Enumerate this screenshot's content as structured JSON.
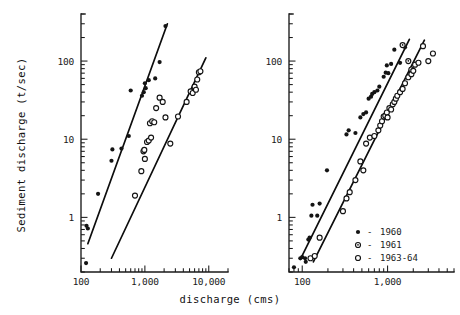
{
  "figure": {
    "xlabel": "discharge (cms)",
    "ylabel": "Sediment discharge (t/sec)",
    "ink_color": "#141414",
    "background": "#ffffff"
  },
  "legend": {
    "position": "lower-right of right panel",
    "entries": [
      {
        "marker": "filled-circle",
        "dash": "-",
        "label": "1960"
      },
      {
        "marker": "dotted-circle",
        "dash": "-",
        "label": "1961"
      },
      {
        "marker": "open-circle",
        "dash": "-",
        "label": "1963-64"
      }
    ]
  },
  "chart_data": [
    {
      "type": "scatter",
      "panel": "left",
      "title": "",
      "xlabel": "discharge (cms)",
      "ylabel": "Sediment discharge (t/sec)",
      "xscale": "log",
      "yscale": "log",
      "xlim": [
        100,
        20000
      ],
      "ylim": [
        0.2,
        400
      ],
      "xticks": [
        100,
        1000,
        10000
      ],
      "xticklabels": [
        "100",
        "1,000",
        "10,000"
      ],
      "yticks": [
        1,
        10,
        100
      ],
      "yticklabels": [
        "1",
        "10",
        "100"
      ],
      "grid": false,
      "series": [
        {
          "name": "1960",
          "marker": "filled-circle",
          "points": [
            [
              120,
              0.26
            ],
            [
              122,
              0.78
            ],
            [
              128,
              0.72
            ],
            [
              185,
              2.0
            ],
            [
              300,
              5.3
            ],
            [
              310,
              7.4
            ],
            [
              430,
              7.6
            ],
            [
              560,
              11.0
            ],
            [
              600,
              42.0
            ],
            [
              900,
              36.0
            ],
            [
              960,
              40.0
            ],
            [
              1000,
              52.0
            ],
            [
              1030,
              45.0
            ],
            [
              1150,
              57.0
            ],
            [
              1450,
              60.0
            ],
            [
              1700,
              97.0
            ],
            [
              2100,
              280.0
            ]
          ]
        },
        {
          "name": "1963-64",
          "marker": "open-circle",
          "points": [
            [
              700,
              1.9
            ],
            [
              880,
              3.9
            ],
            [
              950,
              7.0
            ],
            [
              980,
              7.3
            ],
            [
              1000,
              5.6
            ],
            [
              1080,
              9.2
            ],
            [
              1150,
              9.6
            ],
            [
              1200,
              16.0
            ],
            [
              1250,
              10.5
            ],
            [
              1300,
              17.0
            ],
            [
              1400,
              16.5
            ],
            [
              1500,
              25.0
            ],
            [
              1700,
              34.0
            ],
            [
              1900,
              30.0
            ],
            [
              2100,
              19.0
            ],
            [
              2500,
              8.8
            ],
            [
              3300,
              19.5
            ],
            [
              4500,
              30.0
            ],
            [
              5200,
              41.0
            ],
            [
              5600,
              39.0
            ],
            [
              6000,
              47.0
            ],
            [
              6300,
              43.0
            ],
            [
              6600,
              58.0
            ],
            [
              7000,
              72.0
            ],
            [
              7400,
              74.0
            ]
          ]
        }
      ],
      "fit_lines": [
        {
          "name": "1960 rating curve",
          "x": [
            128,
            2250
          ],
          "y": [
            0.46,
            300.0
          ]
        },
        {
          "name": "1963-64 rating curve",
          "x": [
            300,
            9000
          ],
          "y": [
            0.3,
            110.0
          ]
        }
      ]
    },
    {
      "type": "scatter",
      "panel": "right",
      "title": "",
      "xlabel": "discharge (cms)",
      "ylabel": "Sediment discharge (t/sec)",
      "xscale": "log",
      "yscale": "log",
      "xlim": [
        70,
        6000
      ],
      "ylim": [
        0.2,
        400
      ],
      "xticks": [
        100,
        1000
      ],
      "xticklabels": [
        "100",
        "1,000"
      ],
      "yticks": [
        1,
        10,
        100
      ],
      "yticklabels": [
        "1",
        "10",
        "100"
      ],
      "grid": false,
      "series": [
        {
          "name": "1960",
          "marker": "filled-circle",
          "points": [
            [
              80,
              0.23
            ],
            [
              95,
              0.3
            ],
            [
              100,
              0.31
            ],
            [
              108,
              0.3
            ],
            [
              110,
              0.27
            ],
            [
              118,
              0.52
            ],
            [
              122,
              0.55
            ],
            [
              128,
              1.05
            ],
            [
              132,
              1.45
            ],
            [
              150,
              1.05
            ],
            [
              160,
              1.5
            ],
            [
              195,
              4.0
            ],
            [
              330,
              11.5
            ],
            [
              350,
              13.0
            ],
            [
              420,
              12.0
            ],
            [
              480,
              19.0
            ],
            [
              520,
              21.0
            ],
            [
              560,
              22.0
            ],
            [
              600,
              33.0
            ],
            [
              640,
              35.0
            ],
            [
              660,
              38.0
            ],
            [
              700,
              40.0
            ],
            [
              760,
              42.0
            ],
            [
              800,
              47.0
            ],
            [
              900,
              63.0
            ],
            [
              950,
              71.0
            ],
            [
              980,
              88.0
            ],
            [
              1020,
              70.0
            ],
            [
              1100,
              92.0
            ],
            [
              1200,
              140.0
            ],
            [
              1400,
              95.0
            ],
            [
              1600,
              150.0
            ]
          ]
        },
        {
          "name": "1961",
          "marker": "dotted-circle",
          "points": [
            [
              1500,
              160.0
            ],
            [
              1750,
              100.0
            ],
            [
              1900,
              78.0
            ]
          ]
        },
        {
          "name": "1963-64",
          "marker": "open-circle",
          "points": [
            [
              125,
              0.3
            ],
            [
              140,
              0.32
            ],
            [
              160,
              0.55
            ],
            [
              300,
              1.2
            ],
            [
              330,
              1.75
            ],
            [
              360,
              2.1
            ],
            [
              420,
              3.0
            ],
            [
              480,
              5.2
            ],
            [
              520,
              4.0
            ],
            [
              560,
              8.8
            ],
            [
              620,
              10.5
            ],
            [
              700,
              11.0
            ],
            [
              780,
              13.0
            ],
            [
              820,
              15.0
            ],
            [
              860,
              17.0
            ],
            [
              900,
              19.5
            ],
            [
              940,
              20.0
            ],
            [
              980,
              22.0
            ],
            [
              1000,
              19.0
            ],
            [
              1050,
              25.0
            ],
            [
              1100,
              24.0
            ],
            [
              1150,
              28.0
            ],
            [
              1200,
              30.0
            ],
            [
              1250,
              33.0
            ],
            [
              1300,
              36.0
            ],
            [
              1400,
              40.0
            ],
            [
              1500,
              44.0
            ],
            [
              1600,
              52.0
            ],
            [
              1750,
              62.0
            ],
            [
              1900,
              68.0
            ],
            [
              2000,
              75.0
            ],
            [
              2100,
              90.0
            ],
            [
              2300,
              95.0
            ],
            [
              2600,
              155.0
            ],
            [
              3000,
              100.0
            ],
            [
              3400,
              125.0
            ]
          ]
        }
      ],
      "fit_lines": [
        {
          "name": "1960 rating curve",
          "x": [
            95,
            1800
          ],
          "y": [
            0.29,
            190.0
          ]
        },
        {
          "name": "1963-64 rating curve",
          "x": [
            135,
            2700
          ],
          "y": [
            0.27,
            185.0
          ]
        }
      ]
    }
  ]
}
